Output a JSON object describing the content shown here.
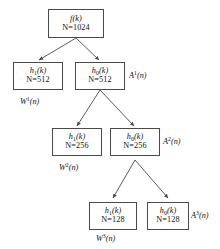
{
  "diagram": {
    "background_color": "#ffffff",
    "line_color": "#4a4a4a",
    "text_color": "#111111",
    "nodes": [
      {
        "id": "root",
        "function": "f(k)",
        "fn_name": "f",
        "fn_sub": "",
        "fn_arg": "(k)",
        "size_label": "N=1024",
        "n_value": 1024
      },
      {
        "id": "l1-left",
        "function": "h1(k)",
        "fn_name": "h",
        "fn_sub": "1",
        "fn_arg": "(k)",
        "size_label": "N=512",
        "n_value": 512
      },
      {
        "id": "l1-right",
        "function": "h0(k)",
        "fn_name": "h",
        "fn_sub": "0",
        "fn_arg": "(k)",
        "size_label": "N=512",
        "n_value": 512
      },
      {
        "id": "l2-left",
        "function": "h1(k)",
        "fn_name": "h",
        "fn_sub": "1",
        "fn_arg": "(k)",
        "size_label": "N=256",
        "n_value": 256
      },
      {
        "id": "l2-right",
        "function": "h0(k)",
        "fn_name": "h",
        "fn_sub": "0",
        "fn_arg": "(k)",
        "size_label": "N=256",
        "n_value": 256
      },
      {
        "id": "l3-left",
        "function": "h1(k)",
        "fn_name": "h",
        "fn_sub": "1",
        "fn_arg": "(k)",
        "size_label": "N=128",
        "n_value": 128
      },
      {
        "id": "l3-right",
        "function": "h0(k)",
        "fn_name": "h",
        "fn_sub": "0",
        "fn_arg": "(k)",
        "size_label": "N=128",
        "n_value": 128
      }
    ],
    "approximation_labels": [
      {
        "id": "A1",
        "sym": "A",
        "sup": "1",
        "arg": "(n)"
      },
      {
        "id": "A2",
        "sym": "A",
        "sup": "2",
        "arg": "(n)"
      },
      {
        "id": "A3",
        "sym": "A",
        "sup": "3",
        "arg": "(n)"
      }
    ],
    "detail_labels": [
      {
        "id": "W1",
        "sym": "W",
        "sup": "1",
        "arg": "(n)"
      },
      {
        "id": "W2",
        "sym": "W",
        "sup": "2",
        "arg": "(n)"
      },
      {
        "id": "W3",
        "sym": "W",
        "sup": "3",
        "arg": "(n)"
      }
    ]
  }
}
